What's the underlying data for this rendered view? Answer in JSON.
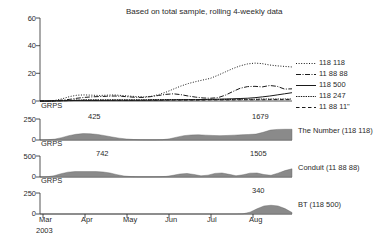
{
  "chart_data": {
    "type": "line",
    "title": "Based on total sample, rolling 4-weekly data",
    "xlabel": "",
    "ylabel": "GRPS",
    "ylim": [
      0,
      60
    ],
    "yticks": [
      "0",
      "20",
      "40",
      "60"
    ],
    "xticks": [
      "Mar",
      "Apr",
      "May",
      "Jun",
      "Jul",
      "Aug"
    ],
    "x_year": "2003",
    "grid": false,
    "legend_position": "right",
    "series": [
      {
        "name": "118 118",
        "style": "dotted",
        "values": [
          0,
          0,
          0.4,
          1.6,
          3.2,
          4.2,
          4.4,
          4.2,
          4.0,
          4.2,
          4.4,
          4.0,
          3.6,
          3.2,
          3.0,
          3.4,
          4.6,
          6.4,
          8.6,
          10.8,
          12.6,
          14.0,
          15.2,
          16.4,
          18.6,
          21.0,
          23.4,
          25.4,
          26.8,
          27.4,
          27.0,
          26.0,
          25.4,
          25.0,
          24.6
        ]
      },
      {
        "name": "11 88 88",
        "style": "dashdot",
        "values": [
          0,
          0,
          0.2,
          0.6,
          1.2,
          2.0,
          2.6,
          3.0,
          3.2,
          3.4,
          3.6,
          3.4,
          3.0,
          2.6,
          2.6,
          3.2,
          4.0,
          4.8,
          5.2,
          4.6,
          3.6,
          2.8,
          2.2,
          2.0,
          2.4,
          4.2,
          6.8,
          9.2,
          10.4,
          10.6,
          10.2,
          11.2,
          10.6,
          8.6,
          8.8
        ]
      },
      {
        "name": "118 500",
        "style": "solid",
        "values": [
          0,
          0,
          0.1,
          0.2,
          0.3,
          0.4,
          0.4,
          0.4,
          0.4,
          0.4,
          0.5,
          0.5,
          0.5,
          0.5,
          0.5,
          0.6,
          0.6,
          0.7,
          0.8,
          0.9,
          1.0,
          1.0,
          1.1,
          1.2,
          1.3,
          1.4,
          1.6,
          1.8,
          2.0,
          2.4,
          3.0,
          3.6,
          4.4,
          5.2,
          6.0
        ]
      },
      {
        "name": "118 247",
        "style": "dotted-dense",
        "values": [
          0,
          0,
          0.1,
          0.3,
          0.5,
          0.7,
          0.8,
          0.8,
          0.8,
          0.9,
          0.9,
          0.9,
          0.8,
          0.8,
          0.9,
          1.0,
          1.0,
          1.1,
          1.1,
          1.0,
          1.0,
          1.0,
          1.0,
          1.1,
          1.1,
          1.2,
          1.2,
          1.3,
          1.3,
          1.3,
          1.4,
          1.4,
          1.4,
          1.4,
          1.5
        ]
      },
      {
        "name": "11 88 11\"",
        "style": "dashed",
        "values": [
          0,
          0,
          0.1,
          0.2,
          0.3,
          0.4,
          0.5,
          0.5,
          0.5,
          0.5,
          0.5,
          0.5,
          0.5,
          0.5,
          0.6,
          0.6,
          0.6,
          0.7,
          0.7,
          0.7,
          0.7,
          0.7,
          0.7,
          0.8,
          0.8,
          0.8,
          0.8,
          0.9,
          0.9,
          0.9,
          0.9,
          1.0,
          1.0,
          1.0,
          1.0
        ]
      }
    ],
    "panels": [
      {
        "label": "The Number (118 118)",
        "axis_label": "GRPS",
        "ylim": [
          0,
          250
        ],
        "yticks": [
          "0",
          "250"
        ],
        "annotations": [
          {
            "text": "425",
            "x_frac": 0.175
          },
          {
            "text": "1679",
            "x_frac": 0.855
          }
        ],
        "values": [
          0,
          2,
          10,
          28,
          52,
          68,
          76,
          74,
          66,
          52,
          36,
          22,
          12,
          6,
          3,
          2,
          2,
          4,
          14,
          34,
          52,
          60,
          62,
          58,
          54,
          52,
          54,
          58,
          62,
          66,
          70,
          92,
          118,
          126,
          128,
          128
        ]
      },
      {
        "label": "Conduit (11 88 88)",
        "axis_label": "GRPS",
        "ylim": [
          0,
          500
        ],
        "yticks": [
          "0",
          "500"
        ],
        "annotations": [
          {
            "text": "742",
            "x_frac": 0.205
          },
          {
            "text": "1505",
            "x_frac": 0.845
          }
        ],
        "values": [
          0,
          4,
          30,
          78,
          116,
          128,
          128,
          128,
          128,
          120,
          96,
          56,
          24,
          10,
          6,
          6,
          6,
          8,
          14,
          40,
          72,
          84,
          60,
          28,
          44,
          86,
          96,
          64,
          30,
          52,
          92,
          96,
          58,
          40,
          92,
          152,
          196
        ]
      },
      {
        "label": "BT (118 500)",
        "axis_label": "GRPS",
        "ylim": [
          0,
          250
        ],
        "yticks": [
          "0",
          "250"
        ],
        "annotations": [
          {
            "text": "340",
            "x_frac": 0.845
          }
        ],
        "values": [
          0,
          0,
          0,
          0,
          0,
          0,
          0,
          0,
          0,
          0,
          0,
          0,
          0,
          0,
          0,
          0,
          0,
          0,
          0,
          0,
          0,
          0,
          0,
          0,
          0,
          0,
          0,
          0,
          0,
          2,
          22,
          62,
          96,
          104,
          96,
          64,
          18
        ]
      }
    ]
  },
  "legend": {
    "items": [
      {
        "label": "118 118"
      },
      {
        "label": "11 88 88"
      },
      {
        "label": "118 500"
      },
      {
        "label": "118 247"
      },
      {
        "label": "11 88 11\""
      }
    ]
  },
  "colors": {
    "line": "#1a1a1a",
    "area_fill": "#8a8a8a",
    "axis": "#2a2a2a",
    "text": "#2a2a2a"
  }
}
